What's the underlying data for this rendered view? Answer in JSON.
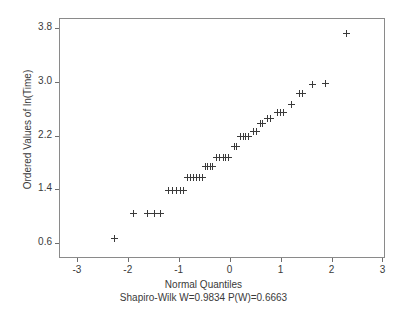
{
  "chart_data": {
    "type": "scatter",
    "title": "",
    "subtitle": "Shapiro-Wilk W=0.9834 P(W)=0.6663",
    "xlabel": "Normal Quantiles",
    "ylabel": "Ordered Values of ln(Time)",
    "xlim": [
      -3.35,
      3.05
    ],
    "ylim": [
      0.38,
      3.95
    ],
    "xticks": [
      -3,
      -2,
      -1,
      0,
      1,
      2,
      3
    ],
    "xticklabels": [
      "-3",
      "-2",
      "-1",
      "0",
      "1",
      "2",
      "3"
    ],
    "yticks": [
      0.6,
      1.4,
      2.2,
      3.0,
      3.8
    ],
    "yticklabels": [
      "0.6",
      "1.4",
      "2.2",
      "3.0",
      "3.8"
    ],
    "grid": false,
    "legend": null,
    "marker": "plus",
    "marker_color": "#3a3a3a",
    "series": [
      {
        "name": "Ordered Values of ln(Time)",
        "x": [
          -2.27,
          -1.88,
          -1.62,
          -1.47,
          -1.35,
          -1.2,
          -1.12,
          -1.04,
          -0.97,
          -0.9,
          -0.83,
          -0.77,
          -0.71,
          -0.65,
          -0.59,
          -0.54,
          -0.48,
          -0.43,
          -0.38,
          -0.33,
          -0.25,
          -0.19,
          -0.13,
          -0.08,
          -0.02,
          0.09,
          0.14,
          0.22,
          0.27,
          0.32,
          0.37,
          0.47,
          0.52,
          0.6,
          0.65,
          0.75,
          0.81,
          0.93,
          0.99,
          1.05,
          1.22,
          1.37,
          1.44,
          1.62,
          1.88,
          2.3
        ],
        "y": [
          0.67,
          1.04,
          1.04,
          1.04,
          1.04,
          1.39,
          1.39,
          1.39,
          1.39,
          1.39,
          1.58,
          1.58,
          1.58,
          1.58,
          1.58,
          1.58,
          1.74,
          1.74,
          1.74,
          1.74,
          1.88,
          1.88,
          1.88,
          1.88,
          1.88,
          2.04,
          2.04,
          2.18,
          2.18,
          2.18,
          2.18,
          2.26,
          2.26,
          2.38,
          2.38,
          2.45,
          2.45,
          2.54,
          2.54,
          2.54,
          2.66,
          2.82,
          2.82,
          2.96,
          2.97,
          3.72
        ]
      }
    ]
  },
  "axis": {
    "x_title": "Normal Quantiles",
    "y_title": "Ordered Values of ln(Time)",
    "subtitle": "Shapiro-Wilk W=0.9834 P(W)=0.6663"
  },
  "stats": {
    "test_name": "Shapiro-Wilk",
    "w_label": "W=0.9834",
    "p_label": "P(W)=0.6663",
    "w_value": 0.9834,
    "p_value": 0.6663
  }
}
